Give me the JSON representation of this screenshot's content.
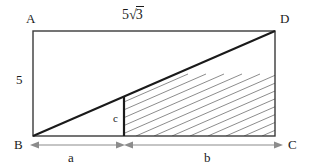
{
  "figure": {
    "type": "geometry-diagram",
    "shape": "rectangle-with-diagonal",
    "vertices": {
      "A": "A",
      "B": "B",
      "C": "C",
      "D": "D"
    },
    "labels": {
      "top_length_prefix": "5",
      "top_length_radicand": "3",
      "top_length_full": "5√3",
      "left_height": "5",
      "vertical_segment": "c",
      "base_left": "a",
      "base_right": "b"
    },
    "geometry": {
      "rect_left": 33,
      "rect_top": 31,
      "rect_right": 275,
      "rect_bottom": 136,
      "divider_x": 124,
      "dimension_line_y": 145,
      "hatch_spacing": 18
    },
    "colors": {
      "stroke": "#1a1a1a",
      "hatch": "#6e6e6e",
      "dimension": "#8c8c8c",
      "background": "#ffffff"
    }
  }
}
